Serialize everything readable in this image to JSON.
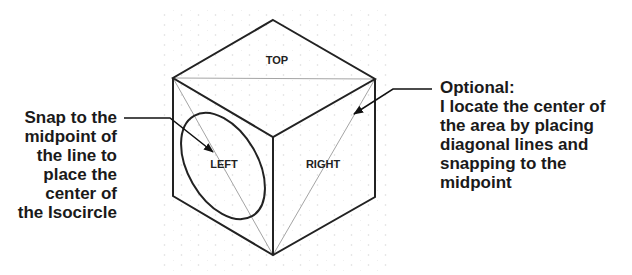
{
  "diagram": {
    "faces": {
      "top": "TOP",
      "left": "LEFT",
      "right": "RIGHT"
    },
    "callouts": {
      "left": {
        "lines": [
          "Snap to the",
          "midpoint of",
          "the line to",
          "place the",
          "center of",
          "the Isocircle"
        ]
      },
      "right": {
        "lines": [
          "Optional:",
          "I locate the center of",
          "the area by placing",
          "diagonal lines and",
          "snapping to the",
          "midpoint"
        ]
      }
    },
    "colors": {
      "edge": "#222222",
      "construction_line": "#9a9a9a",
      "grid_dot": "#d8d8d8",
      "text": "#1a1a1a",
      "background": "#ffffff"
    }
  }
}
